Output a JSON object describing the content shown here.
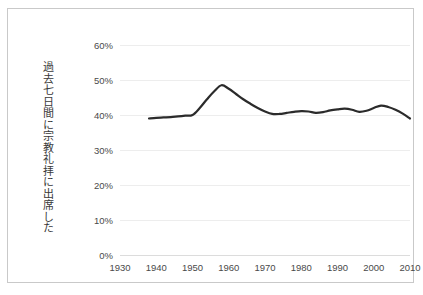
{
  "chart_data": {
    "type": "line",
    "title": "",
    "subtitle": "",
    "xlabel": "",
    "ylabel": "過去七日間に宗教礼拝に出席した",
    "xlim": [
      1930,
      2010
    ],
    "ylim": [
      0,
      60
    ],
    "grid": true,
    "legend": false,
    "legend_position": "none",
    "x_tick_labels": [
      "1930",
      "1940",
      "1950",
      "1960",
      "1970",
      "1980",
      "1990",
      "2000",
      "2010"
    ],
    "x_ticks": [
      1930,
      1940,
      1950,
      1960,
      1970,
      1980,
      1990,
      2000,
      2010
    ],
    "y_tick_labels": [
      "0%",
      "10%",
      "20%",
      "30%",
      "40%",
      "50%",
      "60%"
    ],
    "y_ticks": [
      0,
      10,
      20,
      30,
      40,
      50,
      60
    ],
    "y_unit": "%",
    "series": [
      {
        "name": "過去七日間に宗教礼拝に出席した",
        "color": "#2b2b2b",
        "line_width": 2.2,
        "x": [
          1938,
          1940,
          1942,
          1944,
          1946,
          1948,
          1950,
          1952,
          1954,
          1956,
          1958,
          1960,
          1962,
          1964,
          1966,
          1968,
          1970,
          1972,
          1974,
          1976,
          1978,
          1980,
          1982,
          1984,
          1986,
          1988,
          1990,
          1992,
          1994,
          1996,
          1998,
          2000,
          2002,
          2004,
          2006,
          2008,
          2010
        ],
        "values": [
          39.0,
          39.2,
          39.3,
          39.4,
          39.6,
          39.8,
          40.0,
          42.0,
          44.5,
          46.8,
          48.5,
          47.5,
          46.0,
          44.5,
          43.2,
          42.0,
          41.0,
          40.3,
          40.3,
          40.6,
          40.9,
          41.1,
          41.0,
          40.6,
          40.8,
          41.3,
          41.6,
          41.8,
          41.5,
          40.9,
          41.2,
          42.0,
          42.7,
          42.3,
          41.5,
          40.4,
          39.0
        ]
      }
    ],
    "annotations": []
  },
  "figure": {
    "background_color": "#ffffff",
    "border_color": "#c9c9c9",
    "grid_color": "#ededed",
    "tick_label_color": "#4a4a4a",
    "axis_title_color": "#3a3a3a"
  }
}
